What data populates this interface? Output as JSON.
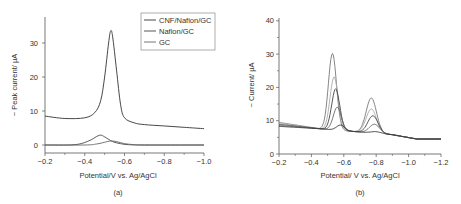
{
  "chart_data": [
    {
      "panel": "(a)",
      "type": "line",
      "title": "",
      "xlabel": "Potential/V vs. Ag/AgCl",
      "ylabel": "− Peak current/ µA",
      "xlim": [
        -0.2,
        -1.0
      ],
      "ylim": [
        -2,
        37
      ],
      "xticks": [
        "-0.2",
        "-0.4",
        "-0.6",
        "-0.8",
        "-1.0"
      ],
      "yticks": [
        "0",
        "10",
        "20",
        "30"
      ],
      "grid": false,
      "legend_position": "upper right",
      "series": [
        {
          "name": "CNF/Nafion/GC",
          "x": [
            -0.2,
            -0.3,
            -0.4,
            -0.45,
            -0.48,
            -0.5,
            -0.52,
            -0.53,
            -0.54,
            -0.56,
            -0.58,
            -0.6,
            -0.65,
            -0.7,
            -0.8,
            -0.9,
            -1.0
          ],
          "y": [
            8.5,
            7.8,
            8.0,
            9.5,
            13,
            20,
            30,
            33.5,
            32,
            22,
            12,
            8,
            6.5,
            6.0,
            5.6,
            5.2,
            4.8
          ]
        },
        {
          "name": "Nafion/GC",
          "x": [
            -0.2,
            -0.35,
            -0.42,
            -0.46,
            -0.48,
            -0.5,
            -0.54,
            -0.58,
            -0.62,
            -0.7,
            -1.0
          ],
          "y": [
            0,
            0.1,
            1.2,
            2.5,
            2.9,
            2.4,
            1.0,
            0.4,
            0.1,
            0,
            0
          ]
        },
        {
          "name": "GC",
          "x": [
            -0.2,
            -0.4,
            -0.46,
            -0.5,
            -0.53,
            -0.56,
            -0.6,
            -0.65,
            -0.7,
            -1.0
          ],
          "y": [
            0,
            0,
            0.3,
            0.8,
            1.2,
            1.0,
            0.4,
            0.1,
            0,
            0
          ]
        }
      ]
    },
    {
      "panel": "(b)",
      "type": "line",
      "title": "",
      "xlabel": "Potential/ V vs. Ag/AgCl",
      "ylabel": "− Current/ µA",
      "xlim": [
        -0.2,
        -1.2
      ],
      "ylim": [
        0,
        40
      ],
      "xticks": [
        "-0.2",
        "-0.4",
        "-0.6",
        "-0.8",
        "-1.0",
        "-1.2"
      ],
      "yticks": [
        "0",
        "10",
        "20",
        "30",
        "40"
      ],
      "grid": false,
      "series": [
        {
          "name": "curve 1",
          "peak1": {
            "x": -0.53,
            "y": 30.5
          },
          "peak2": {
            "x": -0.77,
            "y": 16.5
          },
          "start": 9.5
        },
        {
          "name": "curve 2",
          "peak1": {
            "x": -0.54,
            "y": 23.5
          },
          "peak2": {
            "x": -0.77,
            "y": 13.2
          },
          "start": 9.2
        },
        {
          "name": "curve 3",
          "peak1": {
            "x": -0.55,
            "y": 20.0
          },
          "peak2": {
            "x": -0.78,
            "y": 11.2
          },
          "start": 8.9
        },
        {
          "name": "curve 4",
          "peak1": {
            "x": -0.56,
            "y": 14.5
          },
          "peak2": {
            "x": -0.79,
            "y": 8.7
          },
          "start": 8.6
        },
        {
          "name": "curve 5",
          "peak1": {
            "x": -0.58,
            "y": 9.2
          },
          "peak2": {
            "x": -0.8,
            "y": 6.5
          },
          "start": 8.3
        }
      ],
      "baseline_end": 4.5,
      "valley": {
        "x": -0.65,
        "y": 6.0
      }
    }
  ],
  "panels": {
    "a": {
      "label": "(a)",
      "xlabel": "Potential/V vs. Ag/AgCl",
      "ylabel": "− Peak current/ µA",
      "xticks": [
        "−0.2",
        "−0.4",
        "−0.6",
        "−0.8",
        "−1.0"
      ],
      "yticks": [
        "0",
        "10",
        "20",
        "30"
      ],
      "legend": [
        "CNF/Nafion/GC",
        "Nafion/GC",
        "GC"
      ]
    },
    "b": {
      "label": "(b)",
      "xlabel": "Potential/ V vs. Ag/AgCl",
      "ylabel": "− Current/ µA",
      "xticks": [
        "−0.2",
        "−0.4",
        "−0.6",
        "−0.8",
        "−1.0",
        "−1.2"
      ],
      "yticks": [
        "0",
        "10",
        "20",
        "30",
        "40"
      ]
    }
  },
  "colors": {
    "axis": "#555555",
    "line_dark": "#333333",
    "line_mid": "#666666",
    "line_light": "#999999"
  }
}
